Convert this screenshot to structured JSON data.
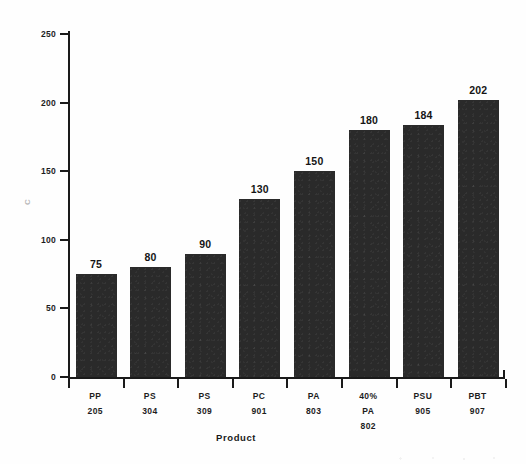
{
  "chart_data": {
    "type": "bar",
    "title": "",
    "subtitle": "",
    "xlabel": "Product",
    "ylabel": "C",
    "ylim": [
      0,
      250
    ],
    "yticks": [
      0,
      50,
      100,
      150,
      200,
      250
    ],
    "ytick_labels": [
      "0",
      "50",
      "100",
      "150",
      "200",
      "250"
    ],
    "grid": false,
    "legend": null,
    "bar_color": "#2a2a2a",
    "axis_color": "#1a1a1a",
    "background": "#ffffff",
    "categories": [
      "PP 205",
      "PS 304",
      "PS 309",
      "PC 901",
      "PA 803",
      "40% PA 802",
      "PSU 905",
      "PBT 907"
    ],
    "category_lines": [
      [
        "PP",
        "205"
      ],
      [
        "PS",
        "304"
      ],
      [
        "PS",
        "309"
      ],
      [
        "PC",
        "901"
      ],
      [
        "PA",
        "803"
      ],
      [
        "40%",
        "PA",
        "802"
      ],
      [
        "PSU",
        "905"
      ],
      [
        "PBT",
        "907"
      ]
    ],
    "values": [
      75,
      80,
      90,
      130,
      150,
      180,
      184,
      202
    ],
    "value_labels": [
      "75",
      "80",
      "90",
      "130",
      "150",
      "180",
      "184",
      "202"
    ]
  }
}
